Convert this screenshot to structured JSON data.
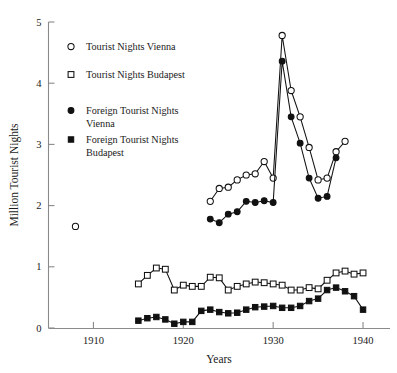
{
  "chart_data": {
    "type": "line",
    "title": "",
    "xlabel": "Years",
    "ylabel": "Million Tourist Nights",
    "xlim": [
      1905,
      1943
    ],
    "ylim": [
      0,
      5
    ],
    "xticks": [
      1910,
      1920,
      1930,
      1940
    ],
    "yticks": [
      0,
      1,
      2,
      3,
      4,
      5
    ],
    "grid": false,
    "legend_position": "upper-left-inside",
    "series": [
      {
        "name": "Tourist Nights Vienna",
        "marker": "open-circle",
        "x": [
          1908,
          1923,
          1924,
          1925,
          1926,
          1927,
          1928,
          1929,
          1930,
          1931,
          1932,
          1933,
          1934,
          1935,
          1936,
          1937,
          1938
        ],
        "y": [
          1.66,
          2.07,
          2.28,
          2.3,
          2.42,
          2.5,
          2.52,
          2.72,
          2.45,
          4.78,
          3.88,
          3.45,
          2.95,
          2.42,
          2.45,
          2.88,
          3.05
        ]
      },
      {
        "name": "Tourist Nights Budapest",
        "marker": "open-square",
        "x": [
          1915,
          1916,
          1917,
          1918,
          1919,
          1920,
          1921,
          1922,
          1923,
          1924,
          1925,
          1926,
          1927,
          1928,
          1929,
          1930,
          1931,
          1932,
          1933,
          1934,
          1935,
          1936,
          1937,
          1938,
          1939,
          1940
        ],
        "y": [
          0.72,
          0.86,
          0.98,
          0.96,
          0.62,
          0.7,
          0.68,
          0.68,
          0.83,
          0.82,
          0.62,
          0.68,
          0.72,
          0.75,
          0.74,
          0.72,
          0.7,
          0.62,
          0.62,
          0.66,
          0.64,
          0.78,
          0.9,
          0.93,
          0.88,
          0.9
        ]
      },
      {
        "name": "Foreign Tourist Nights Vienna",
        "marker": "filled-circle",
        "x": [
          1923,
          1924,
          1925,
          1926,
          1927,
          1928,
          1929,
          1930,
          1931,
          1932,
          1933,
          1934,
          1935,
          1936,
          1937
        ],
        "y": [
          1.78,
          1.72,
          1.86,
          1.9,
          2.07,
          2.05,
          2.08,
          2.05,
          4.36,
          3.45,
          3.02,
          2.45,
          2.12,
          2.15,
          2.78
        ]
      },
      {
        "name": "Foreign Tourist Nights Budapest",
        "marker": "filled-square",
        "x": [
          1915,
          1916,
          1917,
          1918,
          1919,
          1920,
          1921,
          1922,
          1923,
          1924,
          1925,
          1926,
          1927,
          1928,
          1929,
          1930,
          1931,
          1932,
          1933,
          1934,
          1935,
          1936,
          1937,
          1938,
          1939,
          1940
        ],
        "y": [
          0.12,
          0.16,
          0.18,
          0.14,
          0.07,
          0.1,
          0.1,
          0.28,
          0.3,
          0.26,
          0.24,
          0.25,
          0.3,
          0.34,
          0.35,
          0.36,
          0.33,
          0.33,
          0.36,
          0.44,
          0.48,
          0.62,
          0.66,
          0.6,
          0.52,
          0.3
        ]
      }
    ]
  },
  "legend": {
    "items": [
      {
        "label": "Tourist Nights Vienna",
        "marker": "open-circle"
      },
      {
        "label": "Tourist Nights Budapest",
        "marker": "open-square"
      },
      {
        "label": "Foreign Tourist Nights",
        "label2": "Vienna",
        "marker": "filled-circle"
      },
      {
        "label": "Foreign Tourist Nights",
        "label2": "Budapest",
        "marker": "filled-square"
      }
    ]
  },
  "axes": {
    "x_title": "Years",
    "y_title": "Million Tourist Nights",
    "x_tick_labels": [
      "1910",
      "1920",
      "1930",
      "1940"
    ],
    "y_tick_labels": [
      "0",
      "1",
      "2",
      "3",
      "4",
      "5"
    ]
  }
}
